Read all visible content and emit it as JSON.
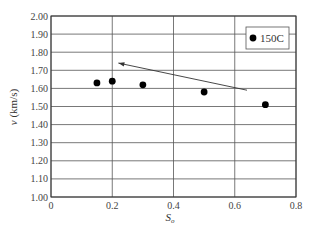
{
  "chart_data": {
    "type": "scatter",
    "title": "",
    "xlabel": "S_o",
    "ylabel": "v (km/s)",
    "xlim": [
      0,
      0.8
    ],
    "ylim": [
      1.0,
      2.0
    ],
    "x_ticks": [
      "0",
      "0.2",
      "0.4",
      "0.6",
      "0.8"
    ],
    "y_ticks": [
      "1.00",
      "1.10",
      "1.20",
      "1.30",
      "1.40",
      "1.50",
      "1.60",
      "1.70",
      "1.80",
      "1.90",
      "2.00"
    ],
    "grid": true,
    "legend_position": "upper right",
    "series": [
      {
        "name": "150C",
        "marker": "filled-circle",
        "color": "#000000",
        "x": [
          0.15,
          0.2,
          0.3,
          0.5,
          0.7
        ],
        "y": [
          1.63,
          1.64,
          1.62,
          1.58,
          1.51
        ]
      }
    ],
    "annotations": [
      {
        "type": "arrow",
        "from": [
          0.64,
          1.59
        ],
        "to": [
          0.22,
          1.74
        ],
        "text": ""
      }
    ]
  },
  "labels": {
    "y_axis_var": "v",
    "y_axis_unit": " (km/s)",
    "x_axis_var": "S",
    "x_axis_sub": "o",
    "legend": "150C"
  }
}
